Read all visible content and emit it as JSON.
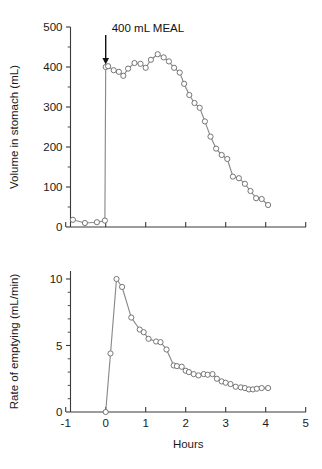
{
  "figure": {
    "background_color": "#ffffff",
    "line_color": "#8a8a8a",
    "marker_fill": "#ffffff",
    "marker_stroke": "#6f6f6f",
    "axis_color": "#3a3a3a",
    "text_color": "#1a1a1a"
  },
  "chart_data": [
    {
      "type": "line",
      "title": "",
      "xlabel": "",
      "ylabel": "Volume in stomach (mL)",
      "xlim": [
        -1,
        5
      ],
      "ylim": [
        0,
        500
      ],
      "xticks": [
        -1,
        0,
        1,
        2,
        3,
        4,
        5
      ],
      "xticklabels": [
        "",
        "",
        "",
        "",
        "",
        "",
        ""
      ],
      "yticks": [
        0,
        100,
        200,
        300,
        400,
        500
      ],
      "yticklabels": [
        "0",
        "100",
        "200",
        "300",
        "400",
        "500"
      ],
      "yminor_ticks": [
        50,
        150,
        250,
        350,
        450
      ],
      "grid": false,
      "legend": "none",
      "annotations": [
        {
          "text": "400 mL MEAL",
          "x": 0.0,
          "y": 500,
          "marker": "down-arrow",
          "arrow_from_y": 480,
          "arrow_to_y": 410
        }
      ],
      "series": [
        {
          "name": "Volume in stomach",
          "x": [
            -0.82,
            -0.52,
            -0.22,
            -0.02,
            0.0,
            0.06,
            0.2,
            0.33,
            0.44,
            0.56,
            0.72,
            0.87,
            1.0,
            1.13,
            1.3,
            1.45,
            1.58,
            1.71,
            1.85,
            1.96,
            2.09,
            2.22,
            2.35,
            2.48,
            2.62,
            2.76,
            2.9,
            3.04,
            3.18,
            3.33,
            3.48,
            3.62,
            3.76,
            3.9,
            4.06
          ],
          "y": [
            18,
            10,
            12,
            16,
            400,
            402,
            392,
            388,
            378,
            396,
            410,
            408,
            398,
            418,
            432,
            424,
            414,
            398,
            386,
            358,
            330,
            310,
            298,
            264,
            226,
            196,
            180,
            170,
            126,
            122,
            108,
            90,
            72,
            70,
            55,
            40,
            36
          ]
        }
      ]
    },
    {
      "type": "line",
      "title": "",
      "xlabel": "Hours",
      "ylabel": "Rate of emptying (mL/min)",
      "xlim": [
        -1,
        5
      ],
      "ylim": [
        0,
        10.6
      ],
      "xticks": [
        -1,
        0,
        1,
        2,
        3,
        4,
        5
      ],
      "xticklabels": [
        "-1",
        "0",
        "1",
        "2",
        "3",
        "4",
        "5"
      ],
      "yticks": [
        0,
        5,
        10
      ],
      "yticklabels": [
        "0",
        "5",
        "10"
      ],
      "yminor_ticks": [
        1,
        2,
        3,
        4,
        6,
        7,
        8,
        9
      ],
      "grid": false,
      "legend": "none",
      "series": [
        {
          "name": "Rate of emptying",
          "x": [
            0.0,
            0.12,
            0.27,
            0.41,
            0.64,
            0.85,
            0.95,
            1.07,
            1.26,
            1.37,
            1.52,
            1.7,
            1.78,
            1.9,
            2.0,
            2.08,
            2.2,
            2.32,
            2.45,
            2.55,
            2.67,
            2.78,
            2.9,
            3.0,
            3.12,
            3.25,
            3.38,
            3.48,
            3.58,
            3.68,
            3.78,
            3.9,
            4.06
          ],
          "y": [
            0.0,
            4.4,
            10.0,
            9.4,
            7.1,
            6.2,
            6.0,
            5.5,
            5.3,
            5.25,
            4.7,
            3.5,
            3.45,
            3.4,
            3.1,
            3.0,
            2.85,
            2.75,
            2.85,
            2.8,
            2.85,
            2.5,
            2.3,
            2.2,
            2.1,
            1.9,
            1.85,
            1.8,
            1.7,
            1.7,
            1.75,
            1.8,
            1.8
          ]
        }
      ]
    }
  ]
}
